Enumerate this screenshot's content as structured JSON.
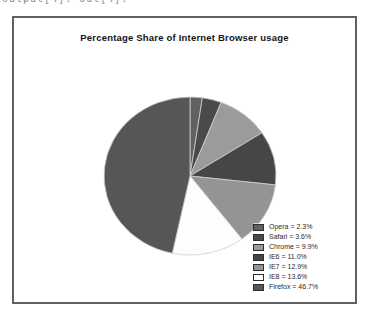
{
  "page": {
    "top_clipped_text": "output[4]:      Out[4]:"
  },
  "chart_data": {
    "type": "pie",
    "title": "Percentage Share of Internet Browser usage",
    "labels": [
      "Opera",
      "Safari",
      "Chrome",
      "IE6",
      "IE7",
      "IE8",
      "Firefox"
    ],
    "values": [
      2.3,
      3.6,
      9.9,
      11.0,
      12.9,
      13.6,
      46.7
    ],
    "legend_entries": [
      "Opera = 2.3%",
      "Safari = 3.6%",
      "Chrome = 9.9%",
      "IE6 = 11.0%",
      "IE7 = 12.9%",
      "IE8 = 13.6%",
      "Firefox = 46.7%"
    ],
    "slice_colors": [
      "#616161",
      "#4a4a4a",
      "#9b9b9b",
      "#464646",
      "#949494",
      "#fdfdfd",
      "#565656"
    ],
    "slice_edge_color": "#cfcfcf",
    "start_angle_deg": 90,
    "direction": "clockwise",
    "legend_position": "lower-right",
    "units": "%"
  }
}
